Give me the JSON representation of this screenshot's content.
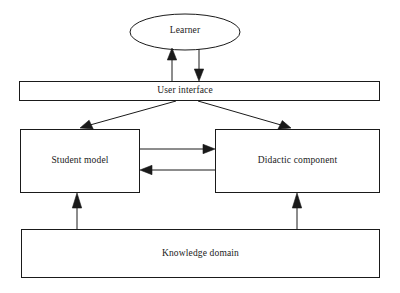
{
  "diagram": {
    "background_color": "#ffffff",
    "stroke_color": "#1a1a1a",
    "text_color": "#1a1a1a",
    "nodes": [
      {
        "id": "learner",
        "label": "Learner",
        "shape": "ellipse",
        "cx": 185,
        "cy": 32,
        "rx": 55,
        "ry": 18
      },
      {
        "id": "user-interface",
        "label": "User interface",
        "shape": "rectangle",
        "x": 19,
        "y": 81,
        "width": 361,
        "height": 20
      },
      {
        "id": "student-model",
        "label": "Student model",
        "shape": "rectangle",
        "x": 20,
        "y": 129,
        "width": 120,
        "height": 64
      },
      {
        "id": "didactic-component",
        "label": "Didactic component",
        "shape": "rectangle",
        "x": 215,
        "y": 129,
        "width": 165,
        "height": 64
      },
      {
        "id": "knowledge-domain",
        "label": "Knowledge domain",
        "shape": "rectangle",
        "x": 21,
        "y": 229,
        "width": 359,
        "height": 49
      }
    ],
    "edges": [
      {
        "id": "ui-to-learner",
        "from": "user-interface",
        "to": "learner",
        "style": "vertical-up",
        "arrowhead": "filled"
      },
      {
        "id": "learner-to-ui",
        "from": "learner",
        "to": "user-interface",
        "style": "vertical-down",
        "arrowhead": "filled"
      },
      {
        "id": "ui-to-student-model",
        "from": "user-interface",
        "to": "student-model",
        "style": "diagonal-left",
        "arrowhead": "filled"
      },
      {
        "id": "ui-to-didactic-component",
        "from": "user-interface",
        "to": "didactic-component",
        "style": "diagonal-right",
        "arrowhead": "filled"
      },
      {
        "id": "student-to-didactic",
        "from": "student-model",
        "to": "didactic-component",
        "style": "horizontal-right",
        "arrowhead": "filled"
      },
      {
        "id": "didactic-to-student",
        "from": "didactic-component",
        "to": "student-model",
        "style": "horizontal-left",
        "arrowhead": "filled"
      },
      {
        "id": "knowledge-to-student-model",
        "from": "knowledge-domain",
        "to": "student-model",
        "style": "vertical-up",
        "arrowhead": "filled"
      },
      {
        "id": "knowledge-to-didactic",
        "from": "knowledge-domain",
        "to": "didactic-component",
        "style": "vertical-up",
        "arrowhead": "filled"
      }
    ]
  }
}
